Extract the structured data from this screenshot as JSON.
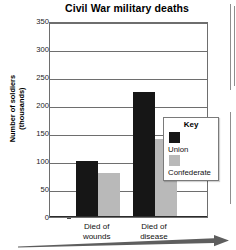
{
  "chart_data": {
    "type": "bar",
    "title": "Civil War military deaths",
    "xlabel": "",
    "ylabel": "Number of soldiers (thousands)",
    "ylabel_line1": "Number of soldiers",
    "ylabel_line2": "(thousands)",
    "categories": [
      "Died of wounds",
      "Died of disease"
    ],
    "category_lines": [
      {
        "line1": "Died of",
        "line2": "wounds"
      },
      {
        "line1": "Died of",
        "line2": "disease"
      }
    ],
    "series": [
      {
        "name": "Union",
        "color": "#161616",
        "values": [
          100,
          224
        ]
      },
      {
        "name": "Confederate",
        "color": "#b9b9b9",
        "values": [
          78,
          140
        ]
      }
    ],
    "ylim": [
      0,
      350
    ],
    "ytick_step": 50,
    "yticks": [
      350,
      300,
      250,
      200,
      150,
      100,
      50,
      0
    ],
    "grid": true,
    "legend_position": "inside-right",
    "legend_title": "Key"
  },
  "legend": {
    "title": "Key",
    "entries": [
      {
        "label": "Union",
        "color": "#161616"
      },
      {
        "label": "Confederate",
        "color": "#b9b9b9"
      }
    ]
  },
  "axis_arrow": {
    "name": "timeline-arrow",
    "direction": "right"
  }
}
